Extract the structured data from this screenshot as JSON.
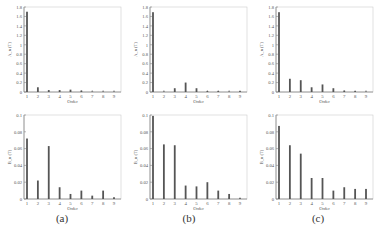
{
  "chart_data": [
    {
      "id": "a-top",
      "type": "bar",
      "panel": "a",
      "row": "top",
      "xlabel": "Order",
      "ylabel": "A_n (T)",
      "categories": [
        1,
        2,
        3,
        4,
        5,
        6,
        7,
        8,
        9
      ],
      "values": [
        1.7,
        0.1,
        0.04,
        0.04,
        0.05,
        0.03,
        0.01,
        0.01,
        0.01
      ],
      "ylim": [
        0,
        1.8
      ],
      "yticks": [
        0,
        0.2,
        0.4,
        0.6,
        0.8,
        1,
        1.2,
        1.4,
        1.6,
        1.8
      ],
      "ytick_labels": [
        "0",
        "0.2",
        "0.4",
        "0.6",
        "0.8",
        "1",
        "1.2",
        "1.4",
        "1.6",
        "1.8"
      ]
    },
    {
      "id": "b-top",
      "type": "bar",
      "panel": "b",
      "row": "top",
      "xlabel": "Order",
      "ylabel": "A_n (T)",
      "categories": [
        1,
        2,
        3,
        4,
        5,
        6,
        7,
        8,
        9
      ],
      "values": [
        1.69,
        0.01,
        0.08,
        0.2,
        0.08,
        0.02,
        0.02,
        0.01,
        0.02
      ],
      "ylim": [
        0,
        1.8
      ],
      "yticks": [
        0,
        0.2,
        0.4,
        0.6,
        0.8,
        1,
        1.2,
        1.4,
        1.6,
        1.8
      ],
      "ytick_labels": [
        "0",
        "0.2",
        "0.4",
        "0.6",
        "0.8",
        "1",
        "1.2",
        "1.4",
        "1.6",
        "1.8"
      ]
    },
    {
      "id": "c-top",
      "type": "bar",
      "panel": "c",
      "row": "top",
      "xlabel": "Order",
      "ylabel": "A_n (T)",
      "categories": [
        1,
        2,
        3,
        4,
        5,
        6,
        7,
        8,
        9
      ],
      "values": [
        1.69,
        0.28,
        0.25,
        0.1,
        0.16,
        0.08,
        0.03,
        0.02,
        0.01
      ],
      "ylim": [
        0,
        1.8
      ],
      "yticks": [
        0,
        0.2,
        0.4,
        0.6,
        0.8,
        1,
        1.2,
        1.4,
        1.6,
        1.8
      ],
      "ytick_labels": [
        "0",
        "0.2",
        "0.4",
        "0.6",
        "0.8",
        "1",
        "1.2",
        "1.4",
        "1.6",
        "1.8"
      ]
    },
    {
      "id": "a-bottom",
      "type": "bar",
      "panel": "a",
      "row": "bottom",
      "xlabel": "Order",
      "ylabel": "B_n (T)",
      "categories": [
        1,
        2,
        3,
        4,
        5,
        6,
        7,
        8,
        9
      ],
      "values": [
        0.072,
        0.022,
        0.063,
        0.014,
        0.006,
        0.01,
        0.004,
        0.01,
        0.002
      ],
      "ylim": [
        0,
        0.1
      ],
      "yticks": [
        0,
        0.02,
        0.04,
        0.06,
        0.08,
        0.1
      ],
      "ytick_labels": [
        "0",
        "0.02",
        "0.04",
        "0.06",
        "0.08",
        "0.1"
      ]
    },
    {
      "id": "b-bottom",
      "type": "bar",
      "panel": "b",
      "row": "bottom",
      "xlabel": "Order",
      "ylabel": "B_n (T)",
      "categories": [
        1,
        2,
        3,
        4,
        5,
        6,
        7,
        8,
        9
      ],
      "values": [
        0.099,
        0.065,
        0.064,
        0.016,
        0.015,
        0.02,
        0.01,
        0.006,
        0.001
      ],
      "ylim": [
        0,
        0.1
      ],
      "yticks": [
        0,
        0.02,
        0.04,
        0.06,
        0.08,
        0.1
      ],
      "ytick_labels": [
        "0",
        "0.02",
        "0.04",
        "0.06",
        "0.08",
        "0.1"
      ]
    },
    {
      "id": "c-bottom",
      "type": "bar",
      "panel": "c",
      "row": "bottom",
      "xlabel": "Order",
      "ylabel": "B_n (T)",
      "categories": [
        1,
        2,
        3,
        4,
        5,
        6,
        7,
        8,
        9
      ],
      "values": [
        0.087,
        0.064,
        0.054,
        0.025,
        0.025,
        0.01,
        0.014,
        0.012,
        0.012
      ],
      "ylim": [
        0,
        0.1
      ],
      "yticks": [
        0,
        0.02,
        0.04,
        0.06,
        0.08,
        0.1
      ],
      "ytick_labels": [
        "0",
        "0.02",
        "0.04",
        "0.06",
        "0.08",
        "0.1"
      ]
    }
  ],
  "captions": {
    "a": "(a)",
    "b": "(b)",
    "c": "(c)"
  },
  "colors": {
    "bar": "#555555",
    "axis": "#888888",
    "grid_frame": "#cccccc",
    "text": "#555555"
  }
}
